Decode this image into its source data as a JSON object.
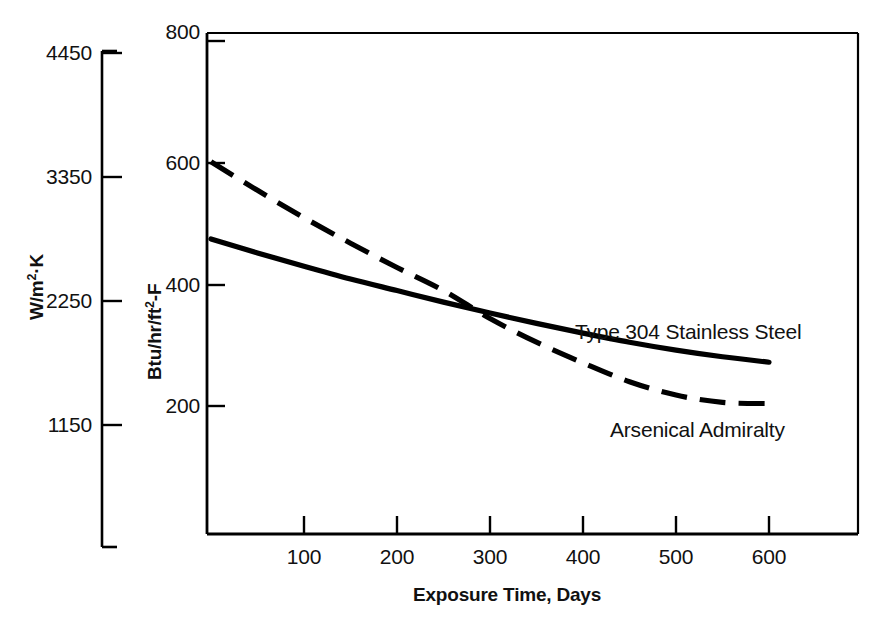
{
  "chart_data": {
    "type": "line",
    "title": "",
    "xlabel": "Exposure Time, Days",
    "ylabel": "Btu/hr/ft2-F",
    "ylabel_secondary": "W/m2-K",
    "xlim": [
      0,
      690
    ],
    "ylim": [
      0,
      800
    ],
    "ylim_secondary": [
      0,
      4870
    ],
    "grid": false,
    "legend_position": "inline-annotations",
    "xticks": [
      100,
      200,
      300,
      400,
      500,
      600
    ],
    "xtick_labels": [
      "100",
      "200",
      "300",
      "400",
      "500",
      "600"
    ],
    "yticks": [
      200,
      400,
      600,
      800
    ],
    "ytick_labels": [
      "200",
      "400",
      "600",
      "800"
    ],
    "yticks_secondary": [
      1150,
      2250,
      3350,
      4450
    ],
    "ytick_labels_secondary": [
      "1150",
      "2250",
      "3350",
      "4450"
    ],
    "series": [
      {
        "name": "Type 304 Stainless Steel",
        "style": "solid",
        "color": "#000000",
        "x": [
          0,
          50,
          100,
          150,
          200,
          250,
          300,
          350,
          400,
          450,
          500,
          550,
          600
        ],
        "values": [
          475,
          452,
          430,
          409,
          390,
          371,
          353,
          336,
          320,
          305,
          292,
          281,
          272
        ]
      },
      {
        "name": "Arsenical Admiralty",
        "style": "dashed",
        "color": "#000000",
        "x": [
          0,
          50,
          100,
          150,
          200,
          250,
          300,
          350,
          400,
          450,
          500,
          550,
          600
        ],
        "values": [
          602,
          555,
          510,
          468,
          428,
          390,
          344,
          305,
          271,
          240,
          218,
          206,
          204
        ]
      }
    ],
    "annotations": [
      {
        "text": "Type 304 Stainless Steel",
        "x": 390,
        "y": 370
      },
      {
        "text": "Arsenical Admiralty",
        "x": 430,
        "y": 168
      }
    ]
  },
  "axes": {
    "x_title": "Exposure Time, Days",
    "y_title_primary_prefix": "Btu/hr/ft",
    "y_title_primary_sup": "2",
    "y_title_primary_suffix": "-F",
    "y_title_secondary_prefix": "W/m",
    "y_title_secondary_sup": "2",
    "y_title_secondary_suffix": "·K"
  }
}
